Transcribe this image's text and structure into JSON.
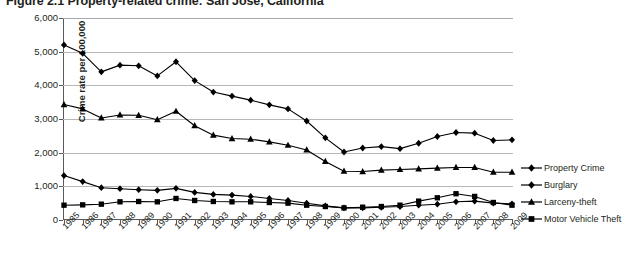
{
  "figure": {
    "number": "Figure 2.1",
    "caption": "Property-related crime: San Jose, California",
    "title_full": "Figure 2.1 Property-related crime: San Jose, California"
  },
  "colors": {
    "ink": "#231f20",
    "axis": "#58595b",
    "gridline": "#b5b7b9",
    "series": "#000000",
    "background": "#ffffff"
  },
  "chart_data": {
    "type": "line",
    "title": "Figure 2.1 Property-related crime: San Jose, California",
    "xlabel": "",
    "ylabel": "Crime rate per 100,000",
    "ylim": [
      0,
      6000
    ],
    "ytick_labels": [
      "6,000",
      "5,000",
      "4,000",
      "3,000",
      "2,000",
      "1,000",
      "0"
    ],
    "ytick_values": [
      6000,
      5000,
      4000,
      3000,
      2000,
      1000,
      0
    ],
    "grid": true,
    "grid_axis": "y",
    "legend_position": "right",
    "categories": [
      "1985",
      "1986",
      "1987",
      "1988",
      "1989",
      "1990",
      "1991",
      "1992",
      "1993",
      "1994",
      "1995",
      "1996",
      "1997",
      "1998",
      "1999",
      "2000",
      "2001",
      "2002",
      "2003",
      "2004",
      "2005",
      "2006",
      "2007",
      "2008",
      "2009"
    ],
    "x": [
      1985,
      1986,
      1987,
      1988,
      1989,
      1990,
      1991,
      1992,
      1993,
      1994,
      1995,
      1996,
      1997,
      1998,
      1999,
      2000,
      2001,
      2002,
      2003,
      2004,
      2005,
      2006,
      2007,
      2008,
      2009
    ],
    "series": [
      {
        "name": "Property Crime",
        "marker": "diamond",
        "values": [
          5200,
          4950,
          4400,
          4600,
          4580,
          4280,
          4700,
          4140,
          3800,
          3680,
          3560,
          3420,
          3300,
          2940,
          2440,
          2020,
          2140,
          2180,
          2120,
          2280,
          2480,
          2600,
          2580,
          2360,
          2380
        ]
      },
      {
        "name": "Burglary",
        "marker": "diamond",
        "values": [
          1320,
          1140,
          960,
          930,
          900,
          880,
          940,
          820,
          760,
          740,
          700,
          640,
          580,
          500,
          420,
          360,
          360,
          380,
          400,
          440,
          470,
          540,
          560,
          500,
          480
        ]
      },
      {
        "name": "Larceny-theft",
        "marker": "triangle",
        "values": [
          3430,
          3300,
          3030,
          3120,
          3110,
          2980,
          3230,
          2800,
          2520,
          2420,
          2400,
          2320,
          2220,
          2080,
          1740,
          1450,
          1440,
          1480,
          1500,
          1520,
          1540,
          1560,
          1560,
          1420,
          1420
        ]
      },
      {
        "name": "Motor Vehicle Theft",
        "marker": "square",
        "values": [
          440,
          450,
          470,
          540,
          550,
          540,
          640,
          580,
          550,
          540,
          540,
          520,
          500,
          440,
          400,
          360,
          380,
          400,
          440,
          560,
          660,
          780,
          700,
          520,
          440
        ]
      }
    ]
  }
}
